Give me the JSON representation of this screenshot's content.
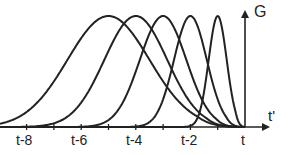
{
  "chart_data": {
    "type": "line",
    "title": "",
    "xlabel": "t'",
    "ylabel": "G",
    "x_ticks": [
      "t-8",
      "t-6",
      "t-4",
      "t-2",
      "t"
    ],
    "x_tick_values": [
      -8,
      -6,
      -4,
      -2,
      0
    ],
    "xlim": [
      -9,
      0.6
    ],
    "ylim": [
      0,
      1.05
    ],
    "grid": false,
    "legend": "none",
    "series": [
      {
        "name": "curve-1",
        "peak_x": -5,
        "peak_y": 1.0,
        "width": 1.5
      },
      {
        "name": "curve-2",
        "peak_x": -4,
        "peak_y": 1.0,
        "width": 1.15
      },
      {
        "name": "curve-3",
        "peak_x": -3,
        "peak_y": 1.0,
        "width": 0.85
      },
      {
        "name": "curve-4",
        "peak_x": -2,
        "peak_y": 1.0,
        "width": 0.6
      },
      {
        "name": "curve-5",
        "peak_x": -1,
        "peak_y": 1.0,
        "width": 0.33
      }
    ]
  },
  "labels": {
    "y_axis": "G",
    "x_axis": "t'",
    "ticks": [
      "t-8",
      "t-6",
      "t-4",
      "t-2",
      "t"
    ]
  }
}
